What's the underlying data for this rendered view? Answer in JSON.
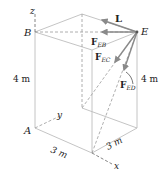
{
  "figure": {
    "points": {
      "A": "A",
      "B": "B",
      "E": "E"
    },
    "axes": {
      "x": "x",
      "y": "y",
      "z": "z"
    },
    "dimensions": {
      "height_left": "4 m",
      "height_right": "4 m",
      "width_front": "3 m",
      "width_right": "3 m"
    },
    "forces": {
      "L": "L",
      "FEB": {
        "main": "F",
        "sub": "EB"
      },
      "FEC": {
        "main": "F",
        "sub": "EC"
      },
      "FED": {
        "main": "F",
        "sub": "ED"
      }
    },
    "colors": {
      "edges": "#b8b8b8",
      "arrows": "#8a8a8a",
      "text": "#222222"
    }
  }
}
